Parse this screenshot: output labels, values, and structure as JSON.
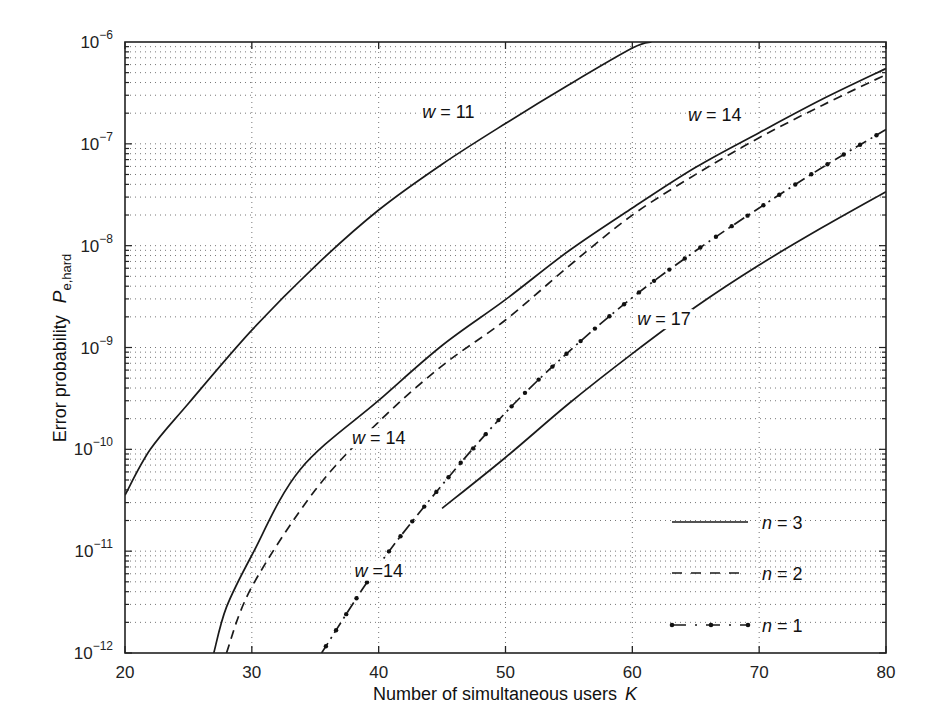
{
  "chart_data": {
    "type": "line",
    "title": "",
    "xlabel": "Number of simultaneous users",
    "xlabel_symbol": "K",
    "ylabel": "Error probability",
    "ylabel_symbol": "P",
    "ylabel_subscript": "e,hard",
    "xlim": [
      20,
      80
    ],
    "ylim_log10": [
      -12,
      -6
    ],
    "yscale": "log",
    "grid": true,
    "x_ticks": [
      20,
      30,
      40,
      50,
      60,
      70,
      80
    ],
    "y_ticks": [
      "10^-12",
      "10^-11",
      "10^-10",
      "10^-9",
      "10^-8",
      "10^-7",
      "10^-6"
    ],
    "y_tick_exponents": [
      -12,
      -11,
      -10,
      -9,
      -8,
      -7,
      -6
    ],
    "series": [
      {
        "name": "n = 3, w = 11",
        "style": "solid",
        "x": [
          20,
          22,
          25,
          30,
          35,
          40,
          45,
          50,
          55,
          60,
          61.5
        ],
        "log10_y": [
          -10.45,
          -10.0,
          -9.55,
          -8.83,
          -8.2,
          -7.65,
          -7.2,
          -6.8,
          -6.42,
          -6.06,
          -6.0
        ]
      },
      {
        "name": "n = 3, w = 14",
        "style": "solid",
        "x": [
          27,
          28,
          30,
          33.8,
          40,
          45,
          50,
          55,
          60,
          65,
          70,
          75,
          80
        ],
        "log10_y": [
          -12.0,
          -11.55,
          -11.04,
          -10.2,
          -9.52,
          -8.98,
          -8.53,
          -8.05,
          -7.63,
          -7.23,
          -6.89,
          -6.56,
          -6.26
        ]
      },
      {
        "name": "n = 2, w = 14",
        "style": "dashed",
        "x": [
          28,
          30,
          35,
          40,
          45,
          50,
          55,
          60,
          65,
          70,
          75,
          80
        ],
        "log10_y": [
          -12.0,
          -11.35,
          -10.4,
          -9.73,
          -9.18,
          -8.73,
          -8.2,
          -7.7,
          -7.3,
          -6.94,
          -6.62,
          -6.32
        ]
      },
      {
        "name": "n = 1, w = 14",
        "style": "dashdot",
        "x": [
          35.5,
          40,
          45,
          50,
          55,
          60,
          65,
          70,
          75,
          80
        ],
        "log10_y": [
          -12.0,
          -11.14,
          -10.35,
          -9.64,
          -9.04,
          -8.51,
          -8.05,
          -7.63,
          -7.23,
          -6.86
        ]
      },
      {
        "name": "n = 3, w = 17",
        "style": "solid",
        "x": [
          45,
          50,
          55,
          60,
          65,
          70,
          75,
          80
        ],
        "log10_y": [
          -10.58,
          -10.08,
          -9.55,
          -9.06,
          -8.6,
          -8.19,
          -7.82,
          -7.47
        ]
      }
    ],
    "annotations": [
      {
        "text": "w = 11",
        "x": 45.5,
        "log10_y": -6.75
      },
      {
        "text": "w = 14",
        "x": 66.5,
        "log10_y": -6.78
      },
      {
        "text": "w = 17",
        "x": 62.5,
        "log10_y": -8.78
      },
      {
        "text": "w = 14",
        "x": 40,
        "log10_y": -9.95
      },
      {
        "text": "w =14",
        "x": 40,
        "log10_y": -11.25
      }
    ],
    "legend": {
      "position": "lower right",
      "entries": [
        {
          "label": "n = 3",
          "style": "solid"
        },
        {
          "label": "n = 2",
          "style": "dashed"
        },
        {
          "label": "n = 1",
          "style": "dashdot"
        }
      ]
    }
  }
}
